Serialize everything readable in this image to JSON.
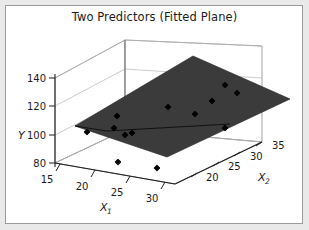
{
  "panel": {
    "background": "#e9e9e9",
    "plot_background": "#ffffff",
    "border_color": "#9a9a9a"
  },
  "chart_data": {
    "type": "scatter",
    "title": "Two Predictors (Fitted Plane)",
    "subtitle": "",
    "projection": "3d",
    "xlabel": "X",
    "xlabel_sub": "1",
    "zlabel": "X",
    "zlabel_sub": "2",
    "ylabel": "Y",
    "grid": true,
    "legend": false,
    "legend_position": "none",
    "plane_color": "#3b3b3b",
    "marker_color": "#000000",
    "marker_shape": "diamond",
    "axes": {
      "x1": {
        "label": "X1",
        "ticks": [
          15,
          20,
          25,
          30
        ],
        "range": [
          13,
          33
        ]
      },
      "x2": {
        "label": "X2",
        "ticks": [
          20,
          25,
          30,
          35
        ],
        "range": [
          17,
          37
        ]
      },
      "y": {
        "label": "Y",
        "ticks": [
          80,
          100,
          120,
          140
        ],
        "range": [
          70,
          150
        ]
      }
    },
    "tick_labels": {
      "x1": [
        "15",
        "20",
        "25",
        "30"
      ],
      "x2": [
        "20",
        "25",
        "30",
        "35"
      ],
      "y": [
        "140",
        "120",
        "100",
        "80"
      ]
    },
    "points": [
      {
        "x1": 17.0,
        "x2": 20.5,
        "y": 96,
        "px": 87,
        "py": 132
      },
      {
        "x1": 20.5,
        "x2": 22.0,
        "y": 112,
        "px": 117,
        "py": 116
      },
      {
        "x1": 21.0,
        "x2": 21.0,
        "y": 104,
        "px": 114,
        "py": 128
      },
      {
        "x1": 23.0,
        "x2": 22.0,
        "y": 100,
        "px": 132,
        "py": 133
      },
      {
        "x1": 23.5,
        "x2": 23.0,
        "y": 102,
        "px": 125,
        "py": 135
      },
      {
        "x1": 25.5,
        "x2": 25.0,
        "y": 122,
        "px": 168,
        "py": 107
      },
      {
        "x1": 27.0,
        "x2": 28.0,
        "y": 118,
        "px": 195,
        "py": 114
      },
      {
        "x1": 28.5,
        "x2": 30.0,
        "y": 128,
        "px": 212,
        "py": 101
      },
      {
        "x1": 30.0,
        "x2": 32.0,
        "y": 134,
        "px": 225,
        "py": 85
      },
      {
        "x1": 31.5,
        "x2": 34.0,
        "y": 130,
        "px": 237,
        "py": 93
      },
      {
        "x1": 29.0,
        "x2": 27.0,
        "y": 108,
        "px": 225,
        "py": 128
      },
      {
        "x1": 21.5,
        "x2": 18.5,
        "y": 76,
        "px": 118,
        "py": 162
      },
      {
        "x1": 25.5,
        "x2": 19.5,
        "y": 74,
        "px": 157,
        "py": 168
      }
    ],
    "plane": {
      "description": "fitted regression plane, tilted upward toward larger X1 and X2",
      "vertices_px": [
        {
          "px": 75,
          "py": 126
        },
        {
          "px": 193,
          "py": 56
        },
        {
          "px": 290,
          "py": 99
        },
        {
          "px": 167,
          "py": 157
        }
      ]
    }
  }
}
